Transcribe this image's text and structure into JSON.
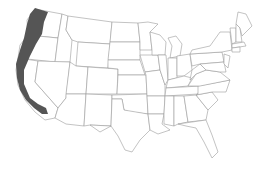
{
  "map": {
    "title": "",
    "region": "Contiguous United States",
    "highlight": {
      "label": "Pacific coastal strip",
      "states": [
        "Washington",
        "Oregon",
        "California"
      ],
      "color": "#555555"
    },
    "outline_color": "#9a9a9a",
    "background": "#ffffff"
  }
}
